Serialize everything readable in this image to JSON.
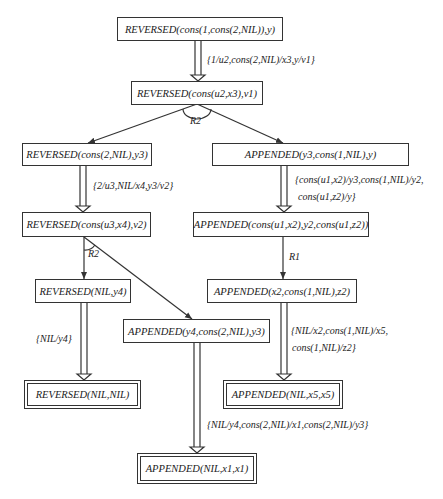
{
  "nodes": {
    "n1": "REVERSED(cons(1,cons(2,NIL)),y)",
    "n2": "REVERSED(cons(u2,x3),v1)",
    "n3": "REVERSED(cons(2,NIL),y3)",
    "n4": "APPENDED(y3,cons(1,NIL),y)",
    "n5": "REVERSED(cons(u3,x4),v2)",
    "n6": "APPENDED(cons(u1,x2),y2,cons(u1,z2))",
    "n7": "REVERSED(NIL,y4)",
    "n8": "APPENDED(x2,cons(1,NIL),z2)",
    "n9": "APPENDED(y4,cons(2,NIL),y3)",
    "n10": "REVERSED(NIL,NIL)",
    "n11": "APPENDED(NIL,x5,x5)",
    "n12": "APPENDED(NIL,x1,x1)"
  },
  "substitutions": {
    "s1": "{1/u2,cons(2,NIL)/x3,y/v1}",
    "s2": "{2/u3,NIL/x4,y3/v2}",
    "s3_line1": "{cons(u1,x2)/y3,cons(1,NIL)/y2,",
    "s3_line2": "cons(u1,z2)/y}",
    "s4": "{NIL/y4}",
    "s5_line1": "{NIL/x2,cons(1,NIL)/x5,",
    "s5_line2": "cons(1,NIL)/z2}",
    "s6": "{NIL/y4,cons(2,NIL)/x1,cons(2,NIL)/y3}"
  },
  "rules": {
    "r_top": "R2",
    "r_left": "R2",
    "r_right": "R1"
  }
}
